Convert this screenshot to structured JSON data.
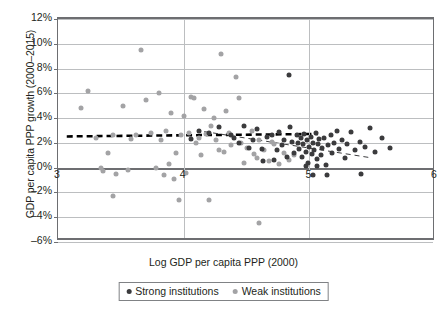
{
  "chart_data": {
    "type": "scatter",
    "title": "",
    "xlabel": "Log GDP per capita PPP (2000)",
    "ylabel": "GDP per capita PPP growth  (2000–2015)",
    "xlim": [
      3,
      6
    ],
    "ylim": [
      -6,
      12
    ],
    "xticks": [
      "3",
      "4",
      "5",
      "6"
    ],
    "xtick_values": [
      3,
      4,
      5,
      6
    ],
    "yticks": [
      "12%",
      "10%",
      "8%",
      "6%",
      "4%",
      "2%",
      "0%",
      "–2%",
      "–4%",
      "–6%"
    ],
    "ytick_values": [
      12,
      10,
      8,
      6,
      4,
      2,
      0,
      -2,
      -4,
      -6
    ],
    "grid": "horizontal-and-vertical",
    "legend_position": "bottom-center",
    "colors": {
      "strong": "#3b3b3d",
      "weak": "#a3a3a5",
      "axis": "#6d6e71",
      "grid": "#bcbec0"
    },
    "series": [
      {
        "name": "Strong institutions",
        "color": "#3b3b3d",
        "points": [
          [
            4.28,
            3.3
          ],
          [
            4.38,
            2.6
          ],
          [
            4.4,
            2.4
          ],
          [
            4.52,
            1.6
          ],
          [
            4.55,
            2.2
          ],
          [
            4.58,
            3.1
          ],
          [
            4.62,
            1.5
          ],
          [
            4.63,
            0.5
          ],
          [
            4.66,
            2.5
          ],
          [
            4.7,
            2.6
          ],
          [
            4.72,
            0.6
          ],
          [
            4.74,
            1.4
          ],
          [
            4.76,
            2.9
          ],
          [
            4.78,
            1.8
          ],
          [
            4.8,
            2.2
          ],
          [
            4.82,
            0.9
          ],
          [
            4.84,
            7.5
          ],
          [
            4.85,
            3.3
          ],
          [
            4.86,
            2.1
          ],
          [
            4.88,
            1.2
          ],
          [
            4.9,
            2.6
          ],
          [
            4.91,
            2.0
          ],
          [
            4.92,
            1.5
          ],
          [
            4.93,
            2.4
          ],
          [
            4.94,
            0.9
          ],
          [
            4.95,
            1.9
          ],
          [
            4.96,
            2.7
          ],
          [
            4.97,
            1.3
          ],
          [
            4.98,
            2.2
          ],
          [
            4.99,
            0.4
          ],
          [
            5.0,
            1.7
          ],
          [
            5.01,
            2.5
          ],
          [
            5.02,
            1.1
          ],
          [
            5.03,
            2.0
          ],
          [
            5.04,
            1.4
          ],
          [
            5.05,
            2.8
          ],
          [
            5.06,
            0.7
          ],
          [
            5.07,
            1.9
          ],
          [
            5.08,
            2.3
          ],
          [
            5.09,
            1.0
          ],
          [
            5.1,
            1.6
          ],
          [
            5.12,
            2.4
          ],
          [
            5.13,
            0.2
          ],
          [
            5.15,
            1.8
          ],
          [
            5.17,
            2.6
          ],
          [
            5.18,
            1.2
          ],
          [
            5.2,
            2.0
          ],
          [
            5.22,
            3.0
          ],
          [
            5.24,
            1.5
          ],
          [
            5.26,
            2.2
          ],
          [
            5.28,
            0.8
          ],
          [
            5.3,
            1.9
          ],
          [
            5.33,
            2.9
          ],
          [
            5.36,
            1.4
          ],
          [
            5.4,
            2.1
          ],
          [
            5.44,
            1.7
          ],
          [
            5.48,
            3.2
          ],
          [
            5.52,
            1.3
          ],
          [
            5.58,
            2.4
          ],
          [
            5.64,
            1.6
          ],
          [
            4.44,
            2.0
          ],
          [
            4.48,
            3.4
          ],
          [
            4.2,
            2.8
          ],
          [
            4.12,
            3.0
          ],
          [
            4.06,
            2.3
          ],
          [
            5.03,
            -0.6
          ],
          [
            5.14,
            -0.6
          ],
          [
            5.41,
            -0.5
          ],
          [
            4.97,
            0.1
          ],
          [
            5.06,
            0.1
          ]
        ]
      },
      {
        "name": "Weak institutions",
        "color": "#a3a3a5",
        "points": [
          [
            3.18,
            4.8
          ],
          [
            3.24,
            6.2
          ],
          [
            3.3,
            2.4
          ],
          [
            3.36,
            -0.3
          ],
          [
            3.4,
            1.2
          ],
          [
            3.44,
            -2.3
          ],
          [
            3.46,
            -0.5
          ],
          [
            3.52,
            5.0
          ],
          [
            3.58,
            2.3
          ],
          [
            3.62,
            2.6
          ],
          [
            3.66,
            9.5
          ],
          [
            3.7,
            5.5
          ],
          [
            3.74,
            2.8
          ],
          [
            3.78,
            0.0
          ],
          [
            3.8,
            6.0
          ],
          [
            3.82,
            2.2
          ],
          [
            3.84,
            -0.6
          ],
          [
            3.86,
            3.0
          ],
          [
            3.88,
            0.3
          ],
          [
            3.9,
            4.4
          ],
          [
            3.92,
            -0.9
          ],
          [
            3.94,
            1.2
          ],
          [
            3.96,
            -2.6
          ],
          [
            3.98,
            2.6
          ],
          [
            4.0,
            4.2
          ],
          [
            4.02,
            -0.4
          ],
          [
            4.04,
            2.8
          ],
          [
            4.06,
            5.7
          ],
          [
            4.08,
            5.6
          ],
          [
            4.1,
            2.0
          ],
          [
            4.12,
            2.4
          ],
          [
            4.14,
            1.0
          ],
          [
            4.16,
            4.7
          ],
          [
            4.18,
            2.7
          ],
          [
            4.2,
            -2.6
          ],
          [
            4.24,
            4.0
          ],
          [
            4.26,
            2.2
          ],
          [
            4.28,
            1.4
          ],
          [
            4.3,
            9.2
          ],
          [
            4.34,
            4.6
          ],
          [
            4.36,
            2.8
          ],
          [
            4.38,
            1.8
          ],
          [
            4.42,
            7.3
          ],
          [
            4.46,
            2.0
          ],
          [
            4.5,
            1.6
          ],
          [
            4.54,
            3.0
          ],
          [
            4.58,
            0.8
          ],
          [
            4.6,
            2.2
          ],
          [
            4.64,
            1.4
          ],
          [
            4.68,
            0.5
          ],
          [
            4.72,
            1.9
          ],
          [
            4.76,
            0.3
          ],
          [
            4.8,
            1.2
          ],
          [
            4.84,
            0.6
          ],
          [
            4.88,
            1.0
          ],
          [
            4.6,
            -4.5
          ],
          [
            3.44,
            2.6
          ],
          [
            3.34,
            0.0
          ],
          [
            3.56,
            -0.2
          ],
          [
            4.22,
            3.4
          ],
          [
            4.44,
            5.6
          ],
          [
            4.7,
            2.1
          ],
          [
            4.56,
            1.1
          ],
          [
            4.48,
            0.4
          ],
          [
            4.32,
            1.3
          ]
        ]
      }
    ],
    "trendlines": [
      {
        "name": "Strong institutions trend",
        "style": "thick-dashed",
        "color": "#000000",
        "x1": 3.07,
        "y1": 2.35,
        "x2": 5.08,
        "y2": 2.55
      },
      {
        "name": "Weak institutions trend",
        "style": "thin-dashed",
        "color": "#3b3b3d",
        "x1": 4.17,
        "y1": 2.75,
        "x2": 5.5,
        "y2": 0.6
      }
    ]
  }
}
